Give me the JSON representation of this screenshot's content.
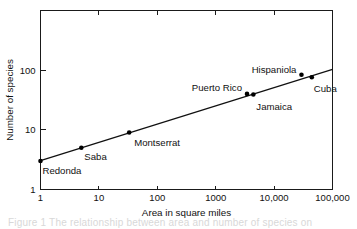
{
  "chart_data": {
    "type": "scatter",
    "title": "",
    "xlabel": "Area in square miles",
    "ylabel": "Number of species",
    "xscale": "log",
    "yscale": "log",
    "xlim": [
      1,
      100000
    ],
    "ylim": [
      1,
      1000
    ],
    "grid": false,
    "legend": "none",
    "x_tick_labels": [
      "1",
      "10",
      "100",
      "1000",
      "10,000",
      "100,000"
    ],
    "x_tick_values": [
      1,
      10,
      100,
      1000,
      10000,
      100000
    ],
    "y_tick_labels": [
      "1",
      "10",
      "100"
    ],
    "y_tick_values": [
      1,
      10,
      100
    ],
    "points": [
      {
        "name": "Redonda",
        "x": 1,
        "y": 3,
        "label_dx": 2,
        "label_dy": 13,
        "label_anchor": "start"
      },
      {
        "name": "Saba",
        "x": 5,
        "y": 5,
        "label_dx": 3,
        "label_dy": 12,
        "label_anchor": "start"
      },
      {
        "name": "Montserrat",
        "x": 33,
        "y": 9,
        "label_dx": 5,
        "label_dy": 13,
        "label_anchor": "start"
      },
      {
        "name": "Puerto Rico",
        "x": 3435,
        "y": 40,
        "label_dx": -5,
        "label_dy": -3,
        "label_anchor": "end"
      },
      {
        "name": "Jamaica",
        "x": 4411,
        "y": 39,
        "label_dx": 3,
        "label_dy": 15,
        "label_anchor": "start"
      },
      {
        "name": "Hispaniola",
        "x": 29418,
        "y": 84,
        "label_dx": -5,
        "label_dy": -2,
        "label_anchor": "end"
      },
      {
        "name": "Cuba",
        "x": 44218,
        "y": 76,
        "label_dx": 2,
        "label_dy": 15,
        "label_anchor": "start"
      }
    ],
    "fit_line": {
      "description": "species-area regression line",
      "x_start": 1,
      "y_start": 3.05,
      "x_end": 100000,
      "y_end": 103
    },
    "colors": {
      "axis": "#1a1a1a",
      "line": "#111111",
      "marker": "#000000",
      "text": "#111111",
      "background": "#ffffff"
    }
  },
  "caption": {
    "ghost_text": "Figure 1   The relationship between area and number of species on"
  }
}
